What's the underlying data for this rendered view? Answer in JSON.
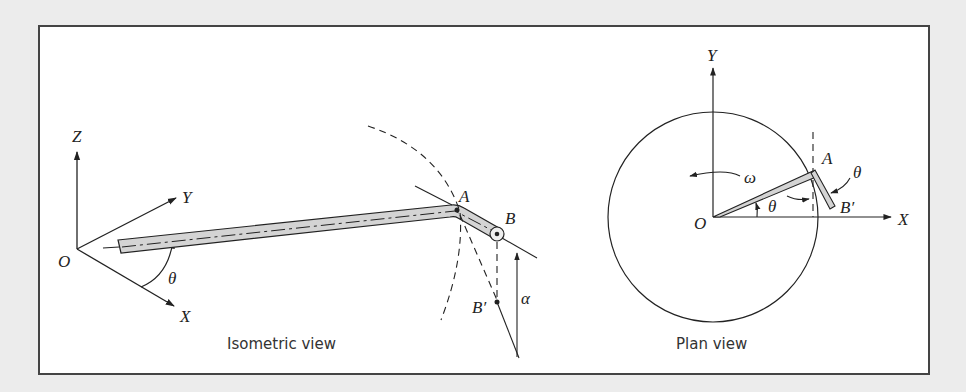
{
  "figure": {
    "panels": [
      {
        "id": "isometric",
        "caption": "Isometric view",
        "labels": {
          "z_axis": "Z",
          "y_axis": "Y",
          "x_axis": "X",
          "origin": "O",
          "angle_theta": "θ",
          "point_a": "A",
          "point_b": "B",
          "point_b_prime": "B′",
          "angle_alpha": "α"
        }
      },
      {
        "id": "plan",
        "caption": "Plan view",
        "labels": {
          "y_axis": "Y",
          "x_axis": "X",
          "origin": "O",
          "angular_velocity": "ω",
          "angle_theta_base": "θ",
          "angle_theta_arm": "θ",
          "point_a": "A",
          "point_b_prime": "B′"
        }
      }
    ],
    "colors": {
      "line": "#222222",
      "rod_fill": "#d4d4d4",
      "frame_border": "#444444",
      "background": "#ececec"
    }
  }
}
